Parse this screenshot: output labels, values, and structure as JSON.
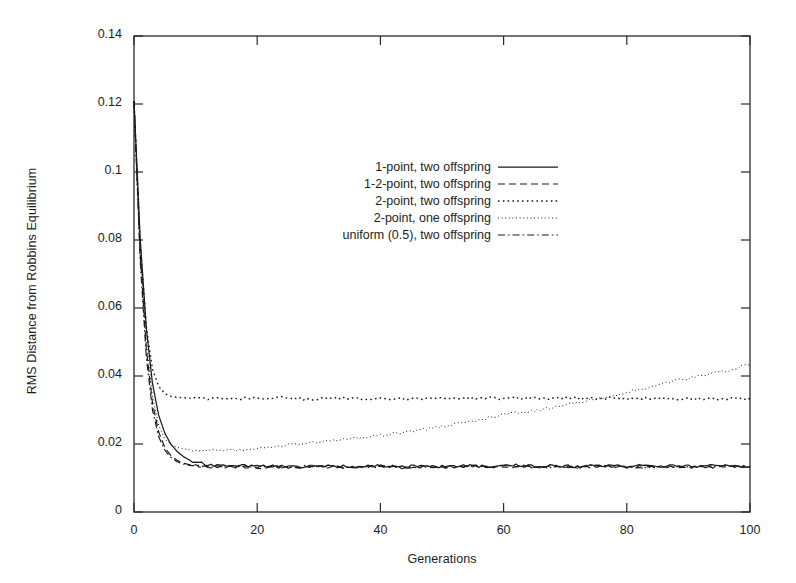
{
  "chart_data": {
    "type": "line",
    "title": "",
    "xlabel": "Generations",
    "ylabel": "RMS Distance from Robbins Equilibrium",
    "xlim": [
      0,
      100
    ],
    "ylim": [
      0,
      0.14
    ],
    "xticks": [
      0,
      20,
      40,
      60,
      80,
      100
    ],
    "xtick_labels": [
      "0",
      "20",
      "40",
      "60",
      "80",
      "100"
    ],
    "yticks": [
      0,
      0.02,
      0.04,
      0.06,
      0.08,
      0.1,
      0.12,
      0.14
    ],
    "ytick_labels": [
      "0",
      "0.02",
      "0.04",
      "0.06",
      "0.08",
      "0.1",
      "0.12",
      "0.14"
    ],
    "grid": false,
    "legend_position": "upper-center",
    "line_color": "#1a1a1a",
    "frame_color": "#2a2a2a",
    "background": "#ffffff",
    "x": [
      0,
      1,
      2,
      3,
      4,
      5,
      6,
      7,
      8,
      9,
      10,
      12,
      14,
      16,
      18,
      20,
      22,
      24,
      26,
      28,
      30,
      32,
      34,
      36,
      38,
      40,
      42,
      44,
      46,
      48,
      50,
      52,
      54,
      56,
      58,
      60,
      62,
      64,
      66,
      68,
      70,
      72,
      74,
      76,
      78,
      80,
      82,
      84,
      86,
      88,
      90,
      92,
      94,
      96,
      98,
      100
    ],
    "series": [
      {
        "name": "1-point, two offspring",
        "dash": "solid",
        "values": [
          0.1208,
          0.0805,
          0.054,
          0.0378,
          0.0285,
          0.0232,
          0.0199,
          0.0178,
          0.0163,
          0.0153,
          0.0147,
          0.014,
          0.0137,
          0.0136,
          0.0136,
          0.0135,
          0.0136,
          0.0135,
          0.0134,
          0.0135,
          0.0136,
          0.0135,
          0.0134,
          0.0133,
          0.0135,
          0.0136,
          0.0135,
          0.0134,
          0.0136,
          0.0135,
          0.0133,
          0.0135,
          0.0136,
          0.0135,
          0.0134,
          0.0136,
          0.0137,
          0.0135,
          0.0134,
          0.0136,
          0.0135,
          0.0134,
          0.0136,
          0.0137,
          0.0135,
          0.0134,
          0.0136,
          0.0135,
          0.0134,
          0.0136,
          0.0135,
          0.0134,
          0.0136,
          0.0137,
          0.0135,
          0.0134
        ]
      },
      {
        "name": "1-2-point, two offspring",
        "dash": "dashed",
        "values": [
          0.1208,
          0.076,
          0.048,
          0.032,
          0.0236,
          0.019,
          0.0166,
          0.0152,
          0.0144,
          0.0139,
          0.0136,
          0.0133,
          0.0132,
          0.0133,
          0.0132,
          0.0131,
          0.0133,
          0.0132,
          0.0131,
          0.0133,
          0.0134,
          0.0132,
          0.0131,
          0.013,
          0.0132,
          0.0134,
          0.0133,
          0.0131,
          0.0133,
          0.0132,
          0.013,
          0.0132,
          0.0134,
          0.0133,
          0.0131,
          0.0133,
          0.0135,
          0.0133,
          0.0131,
          0.0133,
          0.0132,
          0.0131,
          0.0133,
          0.0135,
          0.0133,
          0.0131,
          0.0133,
          0.0132,
          0.0131,
          0.0133,
          0.0132,
          0.0131,
          0.0133,
          0.0135,
          0.0133,
          0.0132
        ]
      },
      {
        "name": "2-point, two offspring",
        "dash": "dotted",
        "values": [
          0.1208,
          0.079,
          0.0545,
          0.042,
          0.037,
          0.0348,
          0.034,
          0.0337,
          0.0336,
          0.0335,
          0.0335,
          0.0334,
          0.0334,
          0.0335,
          0.0334,
          0.0333,
          0.0334,
          0.0335,
          0.0334,
          0.0333,
          0.0334,
          0.0335,
          0.0334,
          0.0333,
          0.0334,
          0.0335,
          0.0334,
          0.0333,
          0.0334,
          0.0335,
          0.0334,
          0.0333,
          0.0334,
          0.0335,
          0.0336,
          0.0335,
          0.0336,
          0.0335,
          0.0334,
          0.0335,
          0.0336,
          0.0335,
          0.0334,
          0.0335,
          0.0334,
          0.0333,
          0.0334,
          0.0335,
          0.0334,
          0.0333,
          0.0334,
          0.0333,
          0.0332,
          0.0333,
          0.0334,
          0.0333
        ]
      },
      {
        "name": "2-point, one offspring",
        "dash": "fine-dotted",
        "values": [
          0.1208,
          0.077,
          0.05,
          0.034,
          0.0255,
          0.0215,
          0.0198,
          0.019,
          0.0186,
          0.0183,
          0.0181,
          0.018,
          0.0181,
          0.0183,
          0.0182,
          0.0185,
          0.019,
          0.0194,
          0.0198,
          0.0202,
          0.0206,
          0.0211,
          0.0214,
          0.0218,
          0.0222,
          0.0226,
          0.0231,
          0.0236,
          0.024,
          0.0245,
          0.0252,
          0.0258,
          0.0263,
          0.027,
          0.0278,
          0.0286,
          0.0292,
          0.0296,
          0.03,
          0.0306,
          0.0314,
          0.0322,
          0.033,
          0.0336,
          0.0344,
          0.0352,
          0.036,
          0.0368,
          0.0378,
          0.0386,
          0.0394,
          0.04,
          0.0408,
          0.0414,
          0.0424,
          0.0435
        ]
      },
      {
        "name": "uniform (0.5), two offspring",
        "dash": "dash-dot",
        "values": [
          0.1208,
          0.074,
          0.0455,
          0.03,
          0.0222,
          0.0182,
          0.016,
          0.0148,
          0.0141,
          0.0137,
          0.0135,
          0.0133,
          0.0133,
          0.0134,
          0.0133,
          0.0132,
          0.0134,
          0.0133,
          0.0132,
          0.0134,
          0.0135,
          0.0133,
          0.0132,
          0.0131,
          0.0133,
          0.0135,
          0.0134,
          0.0132,
          0.0134,
          0.0133,
          0.0131,
          0.0133,
          0.0135,
          0.0134,
          0.0132,
          0.0134,
          0.0136,
          0.0134,
          0.0132,
          0.0134,
          0.0133,
          0.0132,
          0.0134,
          0.0136,
          0.0134,
          0.0132,
          0.0134,
          0.0133,
          0.0132,
          0.0134,
          0.0133,
          0.0132,
          0.0134,
          0.0136,
          0.0134,
          0.0133
        ]
      }
    ]
  },
  "legend": {
    "entries": [
      {
        "label": "1-point, two offspring",
        "dash": "solid"
      },
      {
        "label": "1-2-point, two offspring",
        "dash": "dashed"
      },
      {
        "label": "2-point, two offspring",
        "dash": "dotted"
      },
      {
        "label": "2-point, one offspring",
        "dash": "fine-dotted"
      },
      {
        "label": "uniform (0.5), two offspring",
        "dash": "dash-dot"
      }
    ]
  }
}
